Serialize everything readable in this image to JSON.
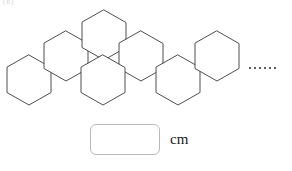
{
  "figure": {
    "shape_name": "hexagon",
    "shape_count_drawn": 7,
    "arrangement": "zigzag-chain",
    "continues": true,
    "ellipsis_dot_count": 6,
    "stroke_color": "#3a3a3a",
    "fill_color": "#ffffff",
    "hexagons": [
      {
        "id": "hex-1",
        "cx": 29,
        "cy": 80
      },
      {
        "id": "hex-2",
        "cx": 66,
        "cy": 56
      },
      {
        "id": "hex-3",
        "cx": 104,
        "cy": 35
      },
      {
        "id": "hex-4",
        "cx": 141,
        "cy": 56
      },
      {
        "id": "hex-5",
        "cx": 178,
        "cy": 80
      },
      {
        "id": "hex-6",
        "cx": 217,
        "cy": 56
      },
      {
        "id": "hex-7",
        "cx": 86,
        "cy": 80
      }
    ],
    "hex_radius_x": 22,
    "hex_radius_y": 25
  },
  "corner_label": {
    "text": "(b)"
  },
  "answer": {
    "value": "",
    "placeholder": "",
    "unit": "cm",
    "box_border_color": "#b9b9b9"
  }
}
